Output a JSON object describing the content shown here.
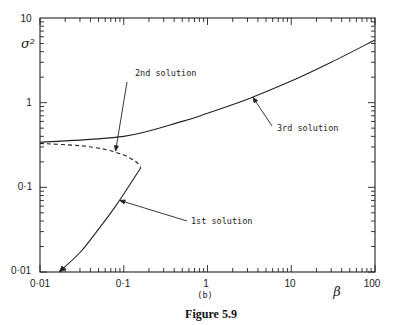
{
  "figure": {
    "caption": "Figure 5.9",
    "panel_label": "(b)"
  },
  "chart_data": {
    "type": "line",
    "title": "",
    "xlabel": "β",
    "ylabel": "σ²",
    "xscale": "log",
    "yscale": "log",
    "xlim": [
      0.01,
      100
    ],
    "ylim": [
      0.01,
      10
    ],
    "x_tick_labels": [
      "0·01",
      "0·1",
      "1",
      "10",
      "100"
    ],
    "y_tick_labels": [
      "0·01",
      "0·1",
      "1",
      "10"
    ],
    "grid": false,
    "legend": null,
    "series": [
      {
        "name": "1st solution",
        "style": "solid",
        "x": [
          0.017,
          0.03,
          0.05,
          0.08,
          0.12,
          0.16
        ],
        "y": [
          0.01,
          0.017,
          0.032,
          0.06,
          0.11,
          0.17
        ]
      },
      {
        "name": "2nd solution",
        "style": "dashed",
        "x": [
          0.01,
          0.03,
          0.06,
          0.1,
          0.14,
          0.16
        ],
        "y": [
          0.33,
          0.31,
          0.28,
          0.24,
          0.2,
          0.17
        ]
      },
      {
        "name": "3rd solution",
        "style": "solid",
        "x": [
          0.01,
          0.1,
          0.5,
          1,
          3,
          10,
          30,
          100
        ],
        "y": [
          0.34,
          0.4,
          0.6,
          0.75,
          1.1,
          1.8,
          3.0,
          5.5
        ]
      }
    ],
    "annotations": [
      {
        "text": "2nd solution",
        "points_to": {
          "x": 0.08,
          "y": 0.27
        }
      },
      {
        "text": "1st solution",
        "points_to": {
          "x": 0.09,
          "y": 0.07
        }
      },
      {
        "text": "3rd solution",
        "points_to": {
          "x": 3.5,
          "y": 1.15
        }
      }
    ]
  }
}
